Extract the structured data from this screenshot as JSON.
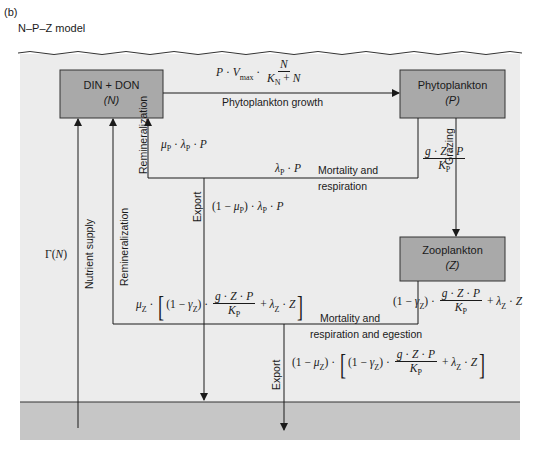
{
  "panel_label": "(b)",
  "model_title": "N–P–Z model",
  "colors": {
    "water": "#ececec",
    "deep_layer": "#c6c6c6",
    "box_fill": "#a9a9a9",
    "line": "#1a1a1a"
  },
  "boxes": {
    "nutrient": {
      "line1": "DIN + DON",
      "line2": "(N)"
    },
    "phytoplankton": {
      "line1": "Phytoplankton",
      "line2": "(P)"
    },
    "zooplankton": {
      "line1": "Zooplankton",
      "line2": "(Z)"
    }
  },
  "flows": {
    "growth_label": "Phytoplankton growth",
    "growth_formula": "P · Vmax · N / (KN + N)",
    "grazing_label": "Grazing",
    "grazing_formula": "g · Z · P / KP",
    "phyto_mortality_label_1": "Mortality and",
    "phyto_mortality_label_2": "respiration",
    "phyto_mortality_formula": "λP · P",
    "phyto_remin_label": "Remineralization",
    "phyto_remin_formula": "μP · λP · P",
    "phyto_export_label": "Export",
    "phyto_export_formula": "(1 − μP) · λP · P",
    "zoo_mortality_label_1": "Mortality and",
    "zoo_mortality_label_2": "respiration and egestion",
    "zoo_mortality_formula": "(1 − γZ) · g · Z · P / KP + λZ · Z",
    "zoo_remin_label": "Remineralization",
    "zoo_remin_formula": "μZ · [(1 − γZ) · g · Z · P / KP + λZ · Z]",
    "zoo_export_label": "Export",
    "zoo_export_formula": "(1 − μZ) · [(1 − γZ) · g · Z · P / KP + λZ · Z]",
    "supply_label": "Nutrient supply",
    "supply_formula": "Γ(N)"
  },
  "math_symbols": {
    "P": "P",
    "N": "N",
    "Z": "Z",
    "g": "g",
    "V": "V",
    "max": "max",
    "K": "K",
    "sub_N": "N",
    "sub_P": "P",
    "sub_Z": "Z",
    "mu": "μ",
    "lambda": "λ",
    "gamma": "γ",
    "Gamma": "Γ",
    "dot": " · ",
    "plus": " + ",
    "one_minus": "(1 − ",
    "close": ")",
    "lbr": "[",
    "rbr": "]"
  }
}
